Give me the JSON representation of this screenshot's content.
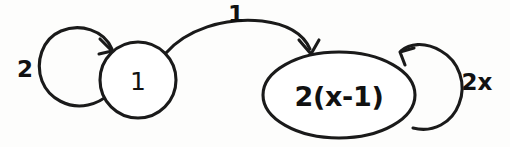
{
  "diagram": {
    "type": "state-transition-diagram",
    "background_color": "#fdfdfc",
    "stroke_color": "#1a1a1a",
    "nodes": [
      {
        "id": "node-one",
        "label": "1",
        "shape": "circle",
        "cx": 138,
        "cy": 80,
        "r": 38
      },
      {
        "id": "node-two-x-minus-one",
        "label": "2(x-1)",
        "shape": "ellipse",
        "cx": 339,
        "cy": 95,
        "rx": 76,
        "ry": 43
      }
    ],
    "edges": [
      {
        "id": "self-loop-left",
        "label": "2",
        "from": "node-one",
        "to": "node-one",
        "kind": "self-loop",
        "label_x": 25,
        "label_y": 69
      },
      {
        "id": "edge-one-to-two-x-minus-one",
        "label": "1",
        "from": "node-one",
        "to": "node-two-x-minus-one",
        "kind": "arc",
        "label_x": 236,
        "label_y": 14
      },
      {
        "id": "self-loop-right",
        "label": "2x",
        "from": "node-two-x-minus-one",
        "to": "node-two-x-minus-one",
        "kind": "self-loop",
        "label_x": 477,
        "label_y": 82
      }
    ]
  }
}
